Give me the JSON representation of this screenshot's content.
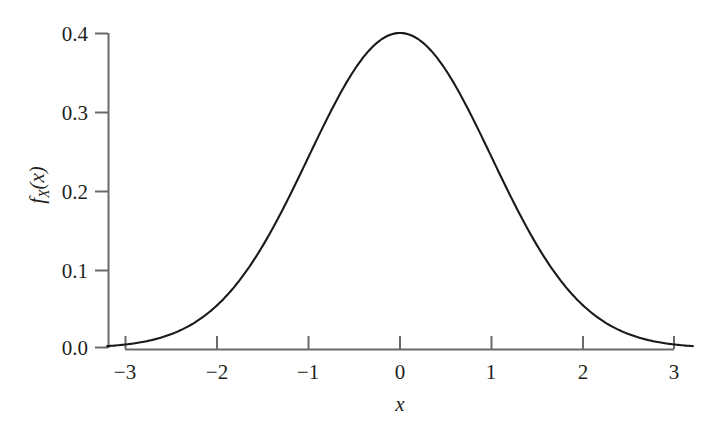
{
  "chart_data": {
    "type": "line",
    "title": "",
    "subtitle": "",
    "xlabel": "x",
    "ylabel": "f_X(x)",
    "ylabel_parts": {
      "f": "f",
      "sub": "X",
      "arg": "(x)"
    },
    "xlim": [
      -3.2,
      3.2
    ],
    "ylim": [
      0.0,
      0.4
    ],
    "xticks": [
      -3,
      -2,
      -1,
      0,
      1,
      2,
      3
    ],
    "xticklabels": [
      "−3",
      "−2",
      "−1",
      "0",
      "1",
      "2",
      "3"
    ],
    "yticks": [
      0.0,
      0.1,
      0.2,
      0.3,
      0.4
    ],
    "yticklabels": [
      "0.0",
      "0.1",
      "0.2",
      "0.3",
      "0.4"
    ],
    "grid": false,
    "legend": false,
    "legend_position": "none",
    "annotations": [],
    "series": [
      {
        "name": "standard normal pdf",
        "description": "Gaussian probability density, mean 0, standard deviation 1",
        "color": "#1a1a1a",
        "linewidth": 2.1,
        "x": [
          -3.2,
          -3.0,
          -2.8,
          -2.6,
          -2.4,
          -2.2,
          -2.0,
          -1.8,
          -1.6,
          -1.4,
          -1.2,
          -1.0,
          -0.8,
          -0.6,
          -0.4,
          -0.2,
          0.0,
          0.2,
          0.4,
          0.6,
          0.8,
          1.0,
          1.2,
          1.4,
          1.6,
          1.8,
          2.0,
          2.2,
          2.4,
          2.6,
          2.8,
          3.0,
          3.2
        ],
        "values": [
          0.0024,
          0.0044,
          0.0079,
          0.0136,
          0.0224,
          0.0355,
          0.054,
          0.079,
          0.1109,
          0.1497,
          0.1942,
          0.242,
          0.2897,
          0.3332,
          0.3683,
          0.391,
          0.3989,
          0.391,
          0.3683,
          0.3332,
          0.2897,
          0.242,
          0.1942,
          0.1497,
          0.1109,
          0.079,
          0.054,
          0.0355,
          0.0224,
          0.0136,
          0.0079,
          0.0044,
          0.0024
        ]
      }
    ],
    "peak": {
      "x": 0,
      "y": 0.4
    },
    "colors": {
      "curve": "#1a1a1a",
      "axis": "#6a6a6a",
      "text": "#231f20",
      "background": "#ffffff"
    }
  }
}
